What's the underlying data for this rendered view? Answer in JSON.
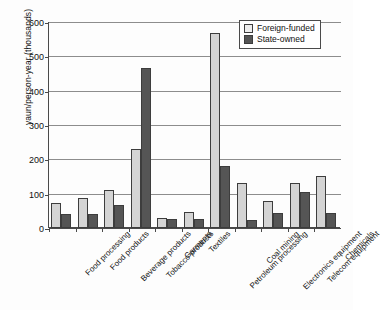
{
  "chart_data": {
    "type": "bar",
    "title": "",
    "xlabel": "",
    "ylabel": "yaun/person-year (thousands)",
    "ylim": [
      0,
      600
    ],
    "yticks": [
      0,
      100,
      200,
      300,
      400,
      500,
      600
    ],
    "grid": true,
    "legend_position": "top-right",
    "categories": [
      "Food processing",
      "Food products",
      "Beverage products",
      "Tobacco products",
      "Garments",
      "Textiles",
      "Petroleum processing",
      "Coal mining",
      "Electronics equipment",
      "Telecom equipment",
      "Chemicals"
    ],
    "series": [
      {
        "name": "Foreign-funded",
        "color": "#d4d4d4",
        "values": [
          72,
          86,
          112,
          230,
          30,
          46,
          568,
          130,
          78,
          130,
          152
        ]
      },
      {
        "name": "State-owned",
        "color": "#555555",
        "values": [
          40,
          41,
          66,
          465,
          25,
          25,
          180,
          22,
          45,
          105,
          45
        ]
      }
    ]
  }
}
